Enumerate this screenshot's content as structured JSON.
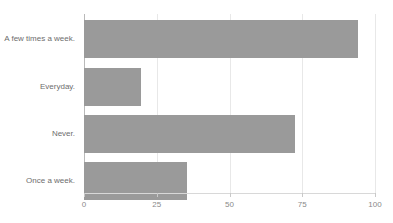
{
  "chart_data": {
    "type": "bar",
    "orientation": "horizontal",
    "title": "",
    "xlabel": "",
    "ylabel": "",
    "categories": [
      "A few times a week.",
      "Everyday.",
      "Never.",
      "Once a week."
    ],
    "values": [
      94,
      19.5,
      72.5,
      35.5
    ],
    "xlim": [
      0,
      100
    ],
    "xticks": [
      0,
      25,
      50,
      75,
      100
    ],
    "xtick_labels": [
      "0",
      "25",
      "50",
      "75",
      "100"
    ],
    "grid": "vertical-only",
    "legend": "none",
    "series": [
      {
        "name": "",
        "values": [
          94,
          19.5,
          72.5,
          35.5
        ]
      }
    ]
  },
  "style": {
    "bar_color": "#9a9a9a",
    "gridline_color": "#e8e8e8",
    "axis_color": "#b9b9b9",
    "label_color": "#6d6d6d",
    "tick_label_color": "#8a8a8a",
    "background": "#ffffff"
  },
  "clipped_top_text": ""
}
